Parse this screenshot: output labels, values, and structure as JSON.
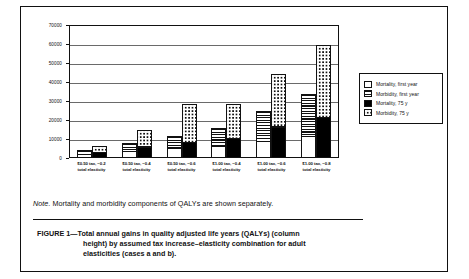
{
  "chart_data": {
    "type": "bar",
    "title": "",
    "xlabel": "",
    "ylabel": "",
    "ylim": [
      0,
      70000
    ],
    "ytick_values": [
      0,
      10000,
      20000,
      30000,
      40000,
      50000,
      60000,
      70000
    ],
    "ytick_labels": [
      "0",
      "10000",
      "20000",
      "30000",
      "40000",
      "50000",
      "60000",
      "70000"
    ],
    "grid": true,
    "legend_position": "right",
    "stacked": true,
    "grouped": true,
    "group_note": "Each category shows two columns: case a (Mortality, first year + Morbidity, first year) and case b (Mortality, 75 y + Morbidity, 75 y)",
    "categories": [
      "$0.50 tax, −0.2 total elasticity",
      "$0.50 tax, −0.4 total elasticity",
      "$0.50 tax, −0.6 total elasticity",
      "$1.00 tax, −0.4 total elasticity",
      "$1.00 tax, −0.6 total elasticity",
      "$1.00 tax, −0.8 total elasticity"
    ],
    "series": [
      {
        "name": "Mortality, first year",
        "bar": "a",
        "values": [
          2200,
          3500,
          5000,
          6200,
          9000,
          11500
        ]
      },
      {
        "name": "Morbidity, first year",
        "bar": "a",
        "values": [
          2300,
          5000,
          7200,
          10000,
          16000,
          22500
        ]
      },
      {
        "name": "Mortality, 75 y",
        "bar": "b",
        "values": [
          3000,
          6000,
          8500,
          10500,
          16500,
          21500
        ]
      },
      {
        "name": "Morbidity, 75 y",
        "bar": "b",
        "values": [
          3500,
          9000,
          20500,
          18500,
          28000,
          38500
        ]
      }
    ],
    "column_totals": {
      "case_a": [
        4500,
        8500,
        12200,
        16200,
        25000,
        34000
      ],
      "case_b": [
        6500,
        15000,
        29000,
        29000,
        44500,
        60000
      ]
    }
  },
  "xaxis": {
    "labels": [
      {
        "line1": "$0.50 tax, −0.2",
        "line2": "total elasticity"
      },
      {
        "line1": "$0.50 tax, −0.4",
        "line2": "total elasticity"
      },
      {
        "line1": "$0.50 tax, −0.6",
        "line2": "total elasticity"
      },
      {
        "line1": "$1.00 tax, −0.4",
        "line2": "total elasticity"
      },
      {
        "line1": "$1.00 tax, −0.6",
        "line2": "total elasticity"
      },
      {
        "line1": "$1.00 tax, −0.8",
        "line2": "total elasticity"
      }
    ]
  },
  "yaxis": {
    "labels": [
      "70000",
      "60000",
      "50000",
      "40000",
      "30000",
      "20000",
      "10000",
      "0"
    ]
  },
  "legend": {
    "items": [
      {
        "label": "Mortality, first year",
        "pattern": "solid-white",
        "color": "#ffffff"
      },
      {
        "label": "Morbidity, first year",
        "pattern": "horizontal-stripes",
        "color": "#111111"
      },
      {
        "label": "Mortality, 75 y",
        "pattern": "solid-black",
        "color": "#000000"
      },
      {
        "label": "Morbidity, 75 y",
        "pattern": "dotted",
        "color": "#111111"
      }
    ]
  },
  "note": {
    "prefix": "Note.",
    "text": " Mortality and morbidity components of QALYs are shown separately."
  },
  "caption": {
    "line1": "FIGURE 1—Total annual gains in quality adjusted life years (QALYs) (column",
    "line2": "height) by assumed tax increase–elasticity combination for adult",
    "line3": "elasticities (cases a and b)."
  }
}
